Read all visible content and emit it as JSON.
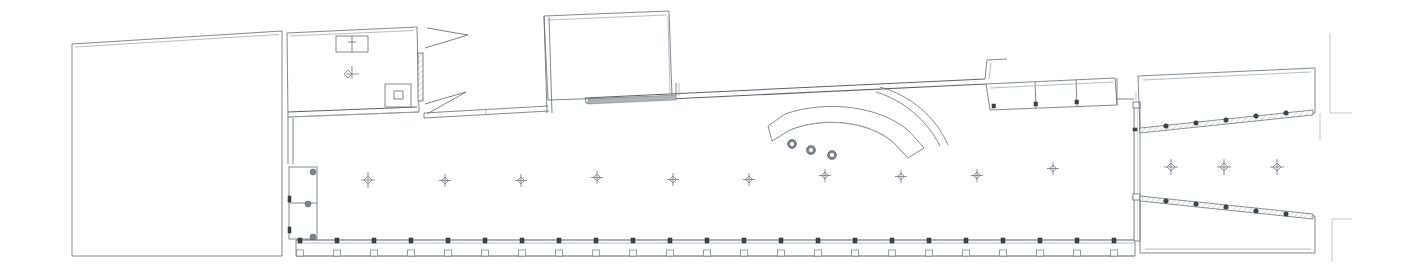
{
  "drawing": {
    "type": "architectural-floor-plan",
    "title": "",
    "background_color": "#ffffff",
    "line_color": "#6f7378",
    "light_line_color": "#9aa0a6",
    "accent_marker_color": "#3f4347",
    "canvas": {
      "width": 1408,
      "height": 274
    }
  },
  "regions": {
    "left_block": {
      "name": "left-rectangular-block",
      "label": "",
      "outline": "72,44 282,31 282,256 72,256"
    },
    "upper_left_room": {
      "name": "upper-left-room",
      "label": "",
      "outline": "287,33 417,27 419,112 288,117"
    },
    "top_center_room": {
      "name": "top-center-projecting-room",
      "label": "",
      "outline": "544,16 669,11 672,96 548,100"
    },
    "main_hall": {
      "name": "main-hall",
      "label": "",
      "note": "large open hall with regular column grid"
    },
    "right_wedge_upper": {
      "name": "right-upper-angled-bay",
      "label": ""
    },
    "right_wedge_lower": {
      "name": "right-lower-angled-bay",
      "label": ""
    }
  },
  "elements": {
    "curved_stair": {
      "name": "curved-stair",
      "label": "",
      "marker_count": 3
    },
    "column_grid_row": {
      "name": "column-grid",
      "label": "",
      "count": 11,
      "x_positions": [
        368,
        445,
        521,
        597,
        673,
        749,
        825,
        901,
        977,
        1053,
        1128
      ],
      "y": 180
    },
    "right_bay_columns": {
      "name": "right-bay-columns",
      "label": "",
      "x_positions": [
        1171,
        1224,
        1277
      ],
      "y": 167
    },
    "bottom_pilasters": {
      "name": "bottom-wall-pilasters",
      "label": "",
      "count": 22,
      "start_x": 299,
      "spacing": 37.5
    },
    "niche_run": {
      "name": "upper-right-niche-run",
      "label": "",
      "bay_count": 3
    },
    "doors": {
      "name": "door-swing-group",
      "label": "",
      "count": 2
    },
    "fixtures": {
      "name": "room-fixtures",
      "label": "",
      "count": 2
    }
  },
  "annotations": {
    "grid_lines": {
      "name": "dimension-grid-lines",
      "label": "",
      "count": 4
    }
  }
}
